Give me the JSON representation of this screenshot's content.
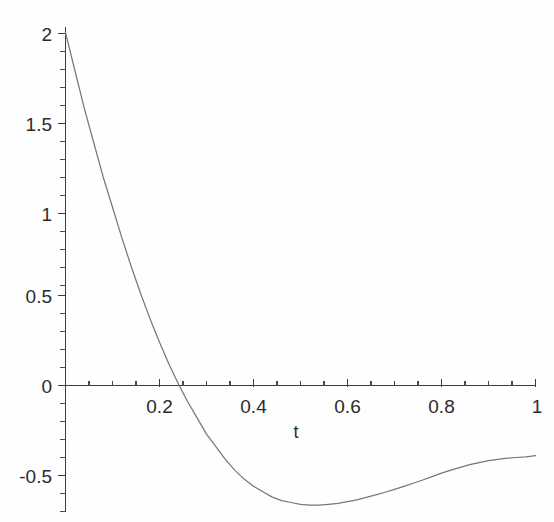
{
  "chart_data": {
    "type": "line",
    "title": "",
    "subtitle": "",
    "xlabel": "t",
    "ylabel": "",
    "xlim": [
      0,
      1
    ],
    "ylim": [
      -0.72,
      2.05
    ],
    "grid": false,
    "legend": null,
    "xticks": [
      0,
      0.2,
      0.4,
      0.6,
      0.8,
      1
    ],
    "xtick_labels": [
      "",
      "0.2",
      "0.4",
      "0.6",
      "0.8",
      "1"
    ],
    "yticks": [
      -0.5,
      0,
      0.5,
      1,
      1.5,
      2
    ],
    "ytick_labels": [
      "-0.5",
      "0",
      "0.5",
      "1",
      "1.5",
      "2"
    ],
    "x_minor_step": 0.05,
    "y_minor_step": 0.1,
    "series": [
      {
        "name": "curve",
        "color": "#777777",
        "x": [
          0,
          0.02,
          0.04,
          0.06,
          0.08,
          0.1,
          0.12,
          0.14,
          0.16,
          0.18,
          0.2,
          0.22,
          0.24,
          0.26,
          0.28,
          0.3,
          0.32,
          0.34,
          0.36,
          0.38,
          0.4,
          0.42,
          0.44,
          0.46,
          0.48,
          0.5,
          0.52,
          0.54,
          0.56,
          0.58,
          0.6,
          0.62,
          0.64,
          0.66,
          0.68,
          0.7,
          0.72,
          0.74,
          0.76,
          0.78,
          0.8,
          0.82,
          0.84,
          0.86,
          0.88,
          0.9,
          0.92,
          0.94,
          0.96,
          0.98,
          1
        ],
        "y": [
          1.96,
          1.75,
          1.54,
          1.35,
          1.16,
          0.99,
          0.82,
          0.66,
          0.51,
          0.37,
          0.24,
          0.12,
          0.01,
          -0.09,
          -0.18,
          -0.27,
          -0.34,
          -0.41,
          -0.47,
          -0.52,
          -0.56,
          -0.59,
          -0.62,
          -0.64,
          -0.65,
          -0.66,
          -0.665,
          -0.665,
          -0.66,
          -0.655,
          -0.645,
          -0.635,
          -0.622,
          -0.608,
          -0.593,
          -0.577,
          -0.56,
          -0.543,
          -0.525,
          -0.506,
          -0.487,
          -0.47,
          -0.455,
          -0.44,
          -0.428,
          -0.417,
          -0.41,
          -0.404,
          -0.4,
          -0.396,
          -0.39
        ]
      }
    ]
  },
  "labels": {
    "x_axis_title": "t",
    "tick_0_2": "0.2",
    "tick_0_4": "0.4",
    "tick_0_6": "0.6",
    "tick_0_8": "0.8",
    "tick_1": "1",
    "tick_2": "2",
    "tick_1_5": "1.5",
    "tick_1_0": "1",
    "tick_0_5": "0.5",
    "tick_0": "0",
    "tick_neg_0_5": "-0.5"
  },
  "colors": {
    "curve": "#777777",
    "axis": "#3d3d3d",
    "text": "#2b2b2b",
    "background": "#fefefe"
  }
}
